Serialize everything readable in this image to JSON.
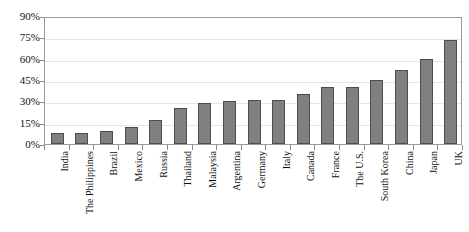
{
  "chart_data": {
    "type": "bar",
    "title": "",
    "xlabel": "",
    "ylabel": "",
    "ylim": [
      0,
      90
    ],
    "y_ticks": [
      0,
      15,
      30,
      45,
      60,
      75,
      90
    ],
    "y_tick_labels": [
      "0%",
      "15%",
      "30%",
      "45%",
      "60%",
      "75%",
      "90%"
    ],
    "grid": true,
    "legend": "none",
    "value_suffix": "%",
    "categories": [
      "India",
      "The Philippines",
      "Brazil",
      "Mexico",
      "Russia",
      "Thailand",
      "Malaysia",
      "Argentina",
      "Germany",
      "Italy",
      "Canada",
      "France",
      "The U.S.",
      "South Korea",
      "China",
      "Japan",
      "UK"
    ],
    "values": [
      8,
      8,
      9,
      12,
      17,
      25,
      29,
      30,
      31,
      31,
      35,
      40,
      40,
      45,
      52,
      60,
      73
    ],
    "series": [
      {
        "name": "Share",
        "values": [
          8,
          8,
          9,
          12,
          17,
          25,
          29,
          30,
          31,
          31,
          35,
          40,
          40,
          45,
          52,
          60,
          73
        ]
      }
    ]
  },
  "style": {
    "bar_fill": "#808080",
    "bar_border": "#4d4d4d",
    "gridline_color": "#e6e6e6",
    "frame_color": "#9a9a9a",
    "background": "#ffffff",
    "text_color": "#111111"
  }
}
